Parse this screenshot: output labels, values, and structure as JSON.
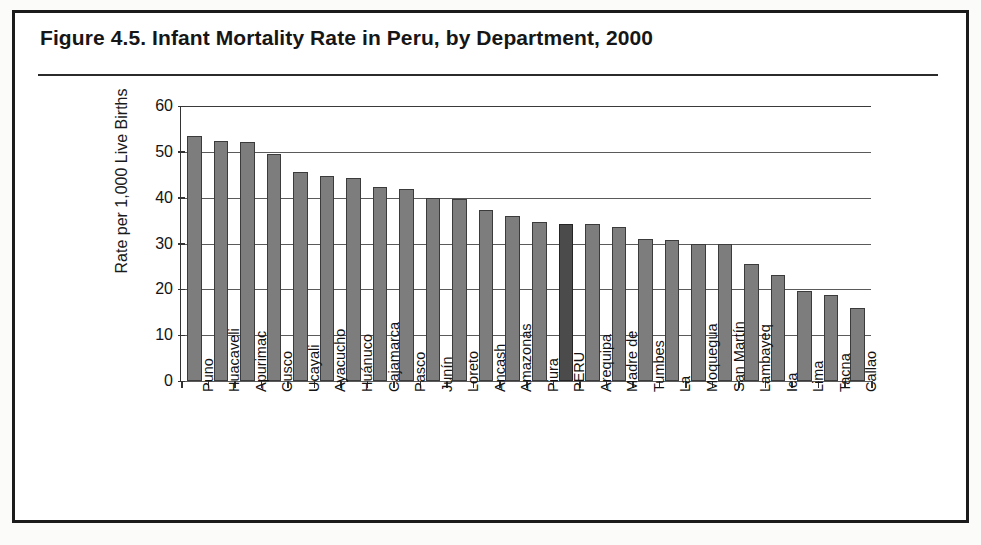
{
  "figure": {
    "title": "Figure 4.5.  Infant Mortality Rate in Peru, by Department, 2000"
  },
  "chart_data": {
    "type": "bar",
    "title": "Figure 4.5.  Infant Mortality Rate in Peru, by Department, 2000",
    "xlabel": "",
    "ylabel": "Rate per 1,000 Live Births",
    "ylim": [
      0,
      60
    ],
    "yticks": [
      0,
      10,
      20,
      30,
      40,
      50,
      60
    ],
    "ytick_labels": [
      "0",
      "10",
      "20",
      "30",
      "40",
      "50",
      "60"
    ],
    "grid": true,
    "legend": "none",
    "highlight_category": "PERU",
    "bar_color": "#7d7d7d",
    "highlight_color": "#4b4b4b",
    "categories": [
      "Puno",
      "Huacaveli",
      "Apurimac",
      "Cusco",
      "Ucayali",
      "Ayacucho",
      "Huánuco",
      "Cajamarca",
      "Pasco",
      "Junín",
      "Loreto",
      "Ancash",
      "Amazonas",
      "Piura",
      "PERU",
      "Arequipa",
      "Madre de",
      "Tumbes",
      "La",
      "Moquegua",
      "San Martín",
      "Lambayeq",
      "Ica",
      "Lima",
      "Tacna",
      "Callao"
    ],
    "values": [
      53.4,
      52.4,
      52.1,
      49.5,
      45.7,
      44.8,
      44.3,
      42.4,
      41.9,
      40.0,
      39.8,
      37.4,
      36.1,
      34.8,
      34.2,
      34.2,
      33.7,
      31.0,
      30.7,
      30.0,
      29.8,
      25.5,
      23.2,
      19.6,
      18.7,
      15.9
    ]
  }
}
